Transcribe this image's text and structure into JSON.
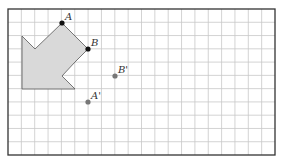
{
  "figure": {
    "grid": {
      "x0": 8,
      "y0": 9,
      "x1": 275,
      "y1": 155,
      "cols": 20,
      "rows": 11,
      "line_color": "#c8c8c8",
      "border_color": "#333333"
    },
    "shape": {
      "fill": "#d9d9d9",
      "stroke": "#555555",
      "points": "22,36 35,49 62,23 88,49 75,62 62,76 75,89 22,89"
    },
    "points": [
      {
        "label": "A",
        "x": 62,
        "y": 23,
        "color": "#111111"
      },
      {
        "label": "B",
        "x": 88,
        "y": 49,
        "color": "#111111"
      },
      {
        "label": "B'",
        "x": 115,
        "y": 76,
        "color": "#777777"
      },
      {
        "label": "A'",
        "x": 88,
        "y": 102,
        "color": "#777777"
      }
    ]
  }
}
